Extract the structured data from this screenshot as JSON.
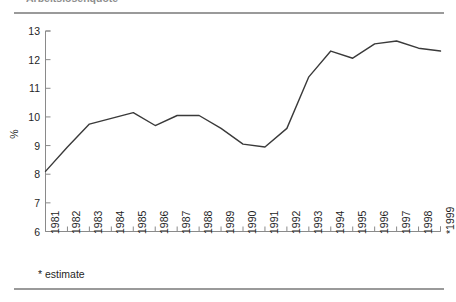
{
  "figure": {
    "title_partial": "Arbeitslosenquote",
    "footnote": "* estimate",
    "rule_color": "#9a9a9a",
    "line_color": "#3a3a3a",
    "axis_color": "#8a8a8a",
    "text_color": "#1f1f1f"
  },
  "chart_data": {
    "type": "line",
    "title": "",
    "xlabel": "",
    "ylabel": "%",
    "ylim": [
      6,
      13
    ],
    "ytick_values": [
      6,
      7,
      8,
      9,
      10,
      11,
      12,
      13
    ],
    "ytick_labels": [
      "6",
      "7",
      "8",
      "9",
      "10",
      "11",
      "12",
      "13"
    ],
    "grid": false,
    "legend": false,
    "categories": [
      "1981",
      "1982",
      "1983",
      "1984",
      "1985",
      "1986",
      "1987",
      "1988",
      "1989",
      "1990",
      "1991",
      "1992",
      "1993",
      "1994",
      "1995",
      "1996",
      "1997",
      "1998",
      "*1999"
    ],
    "values": [
      8.1,
      8.95,
      9.75,
      9.95,
      10.15,
      9.7,
      10.05,
      10.05,
      9.6,
      9.05,
      8.95,
      9.6,
      11.4,
      12.3,
      12.05,
      12.55,
      12.65,
      12.4,
      12.3
    ],
    "annotations": [
      "* estimate"
    ]
  }
}
